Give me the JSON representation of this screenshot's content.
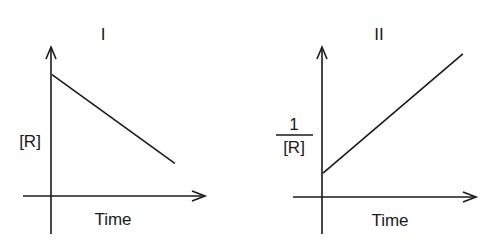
{
  "chart_data": [
    {
      "type": "line",
      "title": "I",
      "xlabel": "Time",
      "ylabel": "[R]",
      "x": [
        0,
        1
      ],
      "series": [
        {
          "name": "[R] vs Time",
          "values": [
            0.82,
            0.22
          ]
        }
      ],
      "xlim": [
        0,
        1.3
      ],
      "ylim": [
        0,
        1
      ],
      "ticks": "none",
      "grid": false
    },
    {
      "type": "line",
      "title": "II",
      "xlabel": "Time",
      "ylabel_numerator": "1",
      "ylabel_denominator": "[R]",
      "x": [
        0,
        1
      ],
      "series": [
        {
          "name": "1/[R] vs Time",
          "values": [
            0.16,
            0.96
          ]
        }
      ],
      "xlim": [
        0,
        1.15
      ],
      "ylim": [
        0,
        1
      ],
      "ticks": "none",
      "grid": false
    }
  ]
}
